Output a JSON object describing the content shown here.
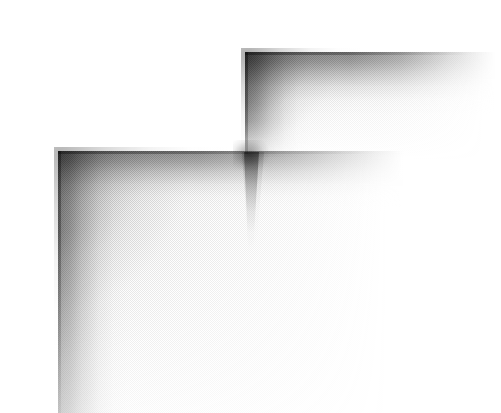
{
  "page": {
    "kind": "scanned-page",
    "width": 501,
    "height": 413,
    "background_color": "#ffffff",
    "visible_text": "",
    "description": "Blank scanned page showing two overlapping soft corner shadows cast by page edges, with halftone scan grain."
  },
  "palette": {
    "paper_white": "#ffffff",
    "shadow_mid_gray": "#9a9a9a",
    "shadow_dark_gray": "#7e7e7e",
    "shadow_edge_gray": "#6e6e6e",
    "grain_gray": "#8c8c8c"
  },
  "shadow_regions": [
    {
      "id": "upper",
      "label": "upper-corner-shadow",
      "corner_x": 245,
      "corner_y": 52,
      "top_band_length": 248,
      "top_band_depth": 62,
      "left_band_length": 102,
      "left_band_width": 64,
      "peak_darkness": "#7e7e7e"
    },
    {
      "id": "lower",
      "label": "lower-corner-shadow",
      "corner_x": 58,
      "corner_y": 151,
      "top_band_length": 342,
      "top_band_depth": 56,
      "left_band_length": 262,
      "left_band_width": 70,
      "peak_darkness": "#7e7e7e"
    }
  ],
  "intersection": {
    "label": "shadow-crossing-point",
    "x": 249,
    "y": 152,
    "tail_length": 100,
    "tail_width": 16,
    "peak_darkness": "#6e6e6e"
  },
  "texture": {
    "label": "halftone-scan-grain",
    "cell_size_px": 2,
    "opacity": 0.5
  }
}
